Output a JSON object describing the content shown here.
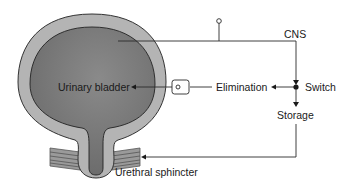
{
  "diagram": {
    "labels": {
      "bladder": "Urinary bladder",
      "cns": "CNS",
      "elimination": "Elimination",
      "switch": "Switch",
      "storage": "Storage",
      "sphincter": "Urethral sphincter"
    },
    "colors": {
      "bladder_wall": "#b4b4b4",
      "bladder_lumen": "#7a7a7a",
      "line": "#2a2a2a"
    }
  }
}
